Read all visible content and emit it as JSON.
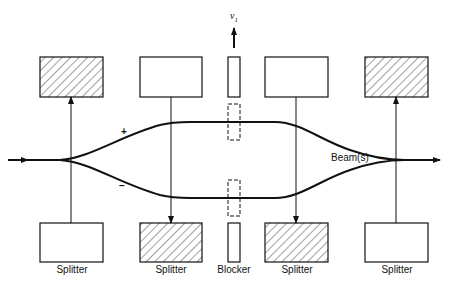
{
  "diagram": {
    "type": "beam-splitter-interferometer",
    "labels": {
      "velocity": "v",
      "velocity_sub": "1",
      "beam": "Beam(s)",
      "plus": "+",
      "minus": "–"
    },
    "bottom_labels": [
      "Splitter",
      "Splitter",
      "Blocker",
      "Splitter",
      "Splitter"
    ],
    "top_elements": [
      {
        "kind": "splitter",
        "hatched": true
      },
      {
        "kind": "splitter",
        "hatched": false
      },
      {
        "kind": "blocker",
        "hatched": false
      },
      {
        "kind": "splitter",
        "hatched": false
      },
      {
        "kind": "splitter",
        "hatched": true
      }
    ],
    "bottom_elements": [
      {
        "kind": "splitter",
        "hatched": false
      },
      {
        "kind": "splitter",
        "hatched": true
      },
      {
        "kind": "blocker",
        "hatched": false
      },
      {
        "kind": "splitter",
        "hatched": true
      },
      {
        "kind": "splitter",
        "hatched": false
      }
    ],
    "colors": {
      "line": "#111111",
      "background": "#ffffff"
    }
  }
}
